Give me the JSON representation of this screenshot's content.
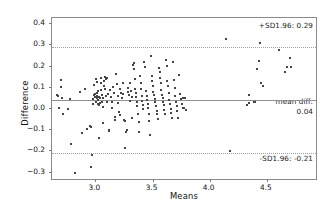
{
  "chart_data": {
    "type": "scatter",
    "title": "",
    "subtitle": "",
    "xlabel": "Means",
    "ylabel": "Difference",
    "xlim": [
      2.62,
      4.93
    ],
    "ylim": [
      -0.335,
      0.425
    ],
    "xticks": [
      3.0,
      3.5,
      4.0,
      4.5
    ],
    "xtick_labels": [
      "3.0",
      "3.5",
      "4.0",
      "4.5"
    ],
    "yticks": [
      0.4,
      0.3,
      0.2,
      0.1,
      0.0,
      -0.1,
      -0.2,
      -0.3
    ],
    "ytick_labels": [
      "0.4",
      "0.3",
      "0.2",
      "0.1",
      "0.0",
      "−0.1",
      "−0.2",
      "−0.3"
    ],
    "grid": false,
    "legend": null,
    "annotations": [
      {
        "name": "upper-limit-of-agreement",
        "text": "+SD1.96: 0.29",
        "value": 0.29,
        "position": "top-right"
      },
      {
        "name": "mean-difference-line1",
        "text": "mean diff:",
        "position": "middle-right"
      },
      {
        "name": "mean-difference-line2",
        "text": "0.04",
        "value": 0.04,
        "position": "middle-right"
      },
      {
        "name": "lower-limit-of-agreement",
        "text": "-SD1.96: -0.21",
        "value": -0.21,
        "position": "bottom-right"
      }
    ],
    "reference_lines": [
      {
        "name": "upper-loa",
        "y": 0.29,
        "style": "dotted",
        "color": "#a0a0a0"
      },
      {
        "name": "mean-diff",
        "y": 0.037,
        "style": "solid",
        "color": "#8f8f8f"
      },
      {
        "name": "lower-loa",
        "y": -0.213,
        "style": "dotted",
        "color": "#a0a0a0"
      }
    ],
    "marker": {
      "color": "#454549",
      "size": 2,
      "shape": "square"
    },
    "points": [
      [
        2.665,
        0.062
      ],
      [
        2.672,
        0.055
      ],
      [
        2.678,
        0.002
      ],
      [
        2.7,
        0.132
      ],
      [
        2.703,
        0.1
      ],
      [
        2.707,
        0.047
      ],
      [
        2.712,
        -0.028
      ],
      [
        2.76,
        -0.006
      ],
      [
        2.775,
        0.041
      ],
      [
        2.79,
        -0.17
      ],
      [
        2.82,
        -0.307
      ],
      [
        2.868,
        0.078
      ],
      [
        2.88,
        -0.12
      ],
      [
        2.905,
        0.092
      ],
      [
        2.93,
        -0.098
      ],
      [
        2.952,
        -0.085
      ],
      [
        2.958,
        -0.09
      ],
      [
        2.965,
        -0.277
      ],
      [
        2.968,
        -0.222
      ],
      [
        2.975,
        0.043
      ],
      [
        2.98,
        0.021
      ],
      [
        2.985,
        0.11
      ],
      [
        2.99,
        0.063
      ],
      [
        2.995,
        0.05
      ],
      [
        3.0,
        0.065
      ],
      [
        3.002,
        0.028
      ],
      [
        3.008,
        0.135
      ],
      [
        3.01,
        0.122
      ],
      [
        3.012,
        0.07
      ],
      [
        3.015,
        0.046
      ],
      [
        3.018,
        0.058
      ],
      [
        3.02,
        0.038
      ],
      [
        3.022,
        0.018
      ],
      [
        3.025,
        0.079
      ],
      [
        3.028,
        0.052
      ],
      [
        3.03,
        0.012
      ],
      [
        3.033,
        -0.143
      ],
      [
        3.038,
        0.046
      ],
      [
        3.04,
        0.026
      ],
      [
        3.045,
        0.14
      ],
      [
        3.048,
        0.118
      ],
      [
        3.052,
        0.084
      ],
      [
        3.055,
        0.062
      ],
      [
        3.058,
        0.03
      ],
      [
        3.062,
        0.048
      ],
      [
        3.065,
        0.005
      ],
      [
        3.07,
        -0.072
      ],
      [
        3.075,
        0.126
      ],
      [
        3.078,
        0.104
      ],
      [
        3.082,
        0.088
      ],
      [
        3.088,
        0.146
      ],
      [
        3.092,
        0.135
      ],
      [
        3.095,
        0.055
      ],
      [
        3.1,
        0.03
      ],
      [
        3.105,
        0.14
      ],
      [
        3.11,
        0.066
      ],
      [
        3.115,
        -0.108
      ],
      [
        3.12,
        -0.102
      ],
      [
        3.128,
        0.083
      ],
      [
        3.135,
        0.052
      ],
      [
        3.142,
        0.028
      ],
      [
        3.148,
        0.002
      ],
      [
        3.155,
        0.1
      ],
      [
        3.16,
        0.07
      ],
      [
        3.168,
        -0.04
      ],
      [
        3.175,
        -0.055
      ],
      [
        3.182,
        0.162
      ],
      [
        3.188,
        0.113
      ],
      [
        3.195,
        0.058
      ],
      [
        3.2,
        0.026
      ],
      [
        3.205,
        -0.02
      ],
      [
        3.212,
        -0.035
      ],
      [
        3.218,
        0.09
      ],
      [
        3.225,
        0.073
      ],
      [
        3.232,
        0.048
      ],
      [
        3.238,
        0.118
      ],
      [
        3.245,
        0.065
      ],
      [
        3.25,
        -0.058
      ],
      [
        3.255,
        -0.062
      ],
      [
        3.262,
        -0.19
      ],
      [
        3.268,
        -0.112
      ],
      [
        3.275,
        -0.105
      ],
      [
        3.282,
        0.095
      ],
      [
        3.288,
        0.075
      ],
      [
        3.295,
        0.06
      ],
      [
        3.3,
        0.035
      ],
      [
        3.305,
        0.12
      ],
      [
        3.312,
        0.082
      ],
      [
        3.318,
        0.05
      ],
      [
        3.322,
        -0.048
      ],
      [
        3.33,
        0.205
      ],
      [
        3.335,
        0.212
      ],
      [
        3.34,
        0.185
      ],
      [
        3.345,
        0.138
      ],
      [
        3.35,
        0.092
      ],
      [
        3.355,
        0.07
      ],
      [
        3.358,
        0.052
      ],
      [
        3.362,
        0.03
      ],
      [
        3.368,
        0.008
      ],
      [
        3.372,
        -0.028
      ],
      [
        3.378,
        -0.068
      ],
      [
        3.382,
        -0.112
      ],
      [
        3.39,
        0.15
      ],
      [
        3.395,
        0.118
      ],
      [
        3.4,
        0.09
      ],
      [
        3.405,
        0.058
      ],
      [
        3.41,
        0.035
      ],
      [
        3.415,
        0.012
      ],
      [
        3.42,
        -0.005
      ],
      [
        3.428,
        0.218
      ],
      [
        3.435,
        0.196
      ],
      [
        3.442,
        0.082
      ],
      [
        3.448,
        0.058
      ],
      [
        3.452,
        0.04
      ],
      [
        3.458,
        0.02
      ],
      [
        3.462,
        -0.002
      ],
      [
        3.468,
        -0.03
      ],
      [
        3.472,
        -0.06
      ],
      [
        3.478,
        -0.128
      ],
      [
        3.485,
        0.245
      ],
      [
        3.492,
        0.152
      ],
      [
        3.498,
        0.128
      ],
      [
        3.502,
        0.102
      ],
      [
        3.508,
        0.078
      ],
      [
        3.512,
        0.06
      ],
      [
        3.518,
        0.045
      ],
      [
        3.522,
        0.028
      ],
      [
        3.528,
        0.01
      ],
      [
        3.535,
        -0.012
      ],
      [
        3.54,
        -0.03
      ],
      [
        3.548,
        -0.052
      ],
      [
        3.555,
        0.19
      ],
      [
        3.562,
        0.168
      ],
      [
        3.568,
        0.142
      ],
      [
        3.572,
        0.118
      ],
      [
        3.578,
        0.085
      ],
      [
        3.582,
        0.062
      ],
      [
        3.588,
        0.048
      ],
      [
        3.592,
        0.03
      ],
      [
        3.598,
        0.012
      ],
      [
        3.602,
        -0.008
      ],
      [
        3.608,
        -0.028
      ],
      [
        3.615,
        0.225
      ],
      [
        3.622,
        0.2
      ],
      [
        3.628,
        0.128
      ],
      [
        3.635,
        0.105
      ],
      [
        3.642,
        0.072
      ],
      [
        3.648,
        0.04
      ],
      [
        3.652,
        0.018
      ],
      [
        3.658,
        -0.005
      ],
      [
        3.662,
        -0.022
      ],
      [
        3.668,
        -0.045
      ],
      [
        3.678,
        0.218
      ],
      [
        3.685,
        0.13
      ],
      [
        3.692,
        0.095
      ],
      [
        3.698,
        0.058
      ],
      [
        3.705,
        0.03
      ],
      [
        3.712,
        0.008
      ],
      [
        3.718,
        -0.012
      ],
      [
        3.725,
        -0.045
      ],
      [
        3.735,
        0.158
      ],
      [
        3.742,
        0.068
      ],
      [
        3.748,
        0.042
      ],
      [
        3.755,
        0.018
      ],
      [
        3.762,
        -0.002
      ],
      [
        3.768,
        0.048
      ],
      [
        3.778,
        0.002
      ],
      [
        3.785,
        0.048
      ],
      [
        3.795,
        -0.01
      ],
      [
        4.14,
        0.325
      ],
      [
        4.18,
        -0.205
      ],
      [
        4.325,
        0.012
      ],
      [
        4.34,
        0.022
      ],
      [
        4.345,
        0.06
      ],
      [
        4.39,
        0.028
      ],
      [
        4.4,
        0.03
      ],
      [
        4.412,
        0.182
      ],
      [
        4.43,
        0.222
      ],
      [
        4.44,
        0.305
      ],
      [
        4.45,
        0.118
      ],
      [
        4.462,
        0.105
      ],
      [
        4.61,
        0.272
      ],
      [
        4.655,
        0.172
      ],
      [
        4.68,
        0.195
      ],
      [
        4.7,
        0.238
      ],
      [
        4.715,
        0.195
      ]
    ]
  },
  "axes": {
    "y_title": "Difference",
    "x_title": "Means"
  }
}
